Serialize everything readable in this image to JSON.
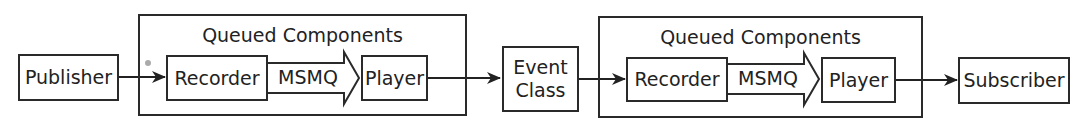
{
  "diagram": {
    "nodes": {
      "publisher": "Publisher",
      "recorder_1": "Recorder",
      "player_1": "Player",
      "event_class_line1": "Event",
      "event_class_line2": "Class",
      "recorder_2": "Recorder",
      "player_2": "Player",
      "subscriber": "Subscriber"
    },
    "groups": [
      {
        "title": "Queued Components"
      },
      {
        "title": "Queued Components"
      }
    ],
    "transports": [
      {
        "label": "MSMQ"
      },
      {
        "label": "MSMQ"
      }
    ],
    "colors": {
      "stroke": "#2a2a2a",
      "background": "#ffffff"
    }
  }
}
